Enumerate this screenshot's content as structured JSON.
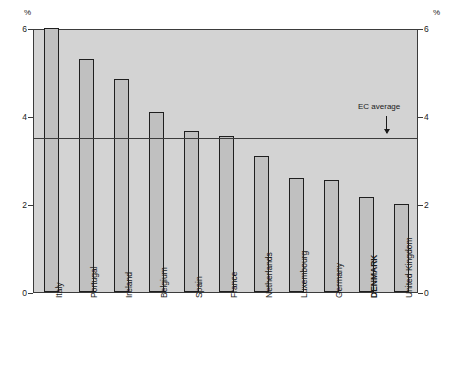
{
  "chart_data": {
    "type": "bar",
    "title": "",
    "subtitle": "",
    "xlabel": "",
    "ylabel": "%",
    "ylabel_right": "%",
    "ylim": [
      0,
      6
    ],
    "yticks": [
      0,
      2,
      4,
      6
    ],
    "ytick_labels": [
      "0",
      "2",
      "4",
      "6"
    ],
    "grid": false,
    "legend": "none",
    "categories": [
      "Italy",
      "Portugal",
      "Ireland",
      "Belgium",
      "Spain",
      "France",
      "Netherlands",
      "Luxembourg",
      "Germany",
      "DENMARK",
      "United Kingdom"
    ],
    "values": [
      6.0,
      5.3,
      4.85,
      4.1,
      3.65,
      3.55,
      3.1,
      2.6,
      2.55,
      2.15,
      2.0
    ],
    "highlight_category": "DENMARK",
    "annotations": [
      {
        "label": "EC average",
        "value": 3.55,
        "type": "reference-line-with-arrow"
      }
    ],
    "colors": {
      "plot_background": "#d3d3d3",
      "bar_fill": "#c0c0c0",
      "bar_border": "#1f1f1f",
      "axis": "#3b3b3b",
      "text": "#1a1a1a",
      "page_background": "#ffffff"
    }
  }
}
